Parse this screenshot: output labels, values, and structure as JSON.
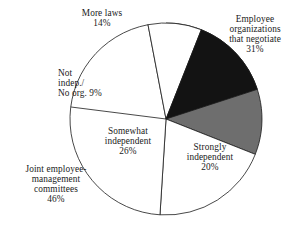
{
  "chart_data": {
    "type": "pie",
    "title": "",
    "subtitle": "",
    "xlabel": "",
    "ylabel": "",
    "legend_position": "none",
    "grid": false,
    "start_angle_deg": 0,
    "direction": "clockwise",
    "units": "percent",
    "total": 100,
    "categories": [
      "Employee organizations that negotiate",
      "Strongly independent",
      "Joint employee-management committees",
      "Not indep./No org.",
      "More laws"
    ],
    "values": [
      31,
      20,
      46,
      9,
      14
    ],
    "colors": [
      "#6e6e6e",
      "#ffffff",
      "#ffffff",
      "#ffffff",
      "#131313"
    ],
    "slices": [
      {
        "name": "employee-organizations",
        "value": 31,
        "value_label": "31%",
        "color": "#6e6e6e",
        "start_deg": 0,
        "end_deg": 111.6,
        "label_lines": [
          "Employee",
          "organizations",
          "that negotiate",
          "31%"
        ]
      },
      {
        "name": "strongly-independent",
        "value": 20,
        "value_label": "20%",
        "color": "#ffffff",
        "start_deg": 111.6,
        "end_deg": 183.6,
        "label_lines": [
          "Strongly",
          "independent",
          "20%"
        ]
      },
      {
        "name": "joint-employee-management-committees",
        "value": 46,
        "value_label": "46%",
        "color": "#ffffff",
        "start_deg": 183.6,
        "end_deg": 349.2,
        "label_lines": [
          "Joint employee-",
          "management",
          "committees",
          "46%"
        ],
        "note": "Label drawn outside at lower left; the 26% Somewhat independent sub-label sits inside this region"
      },
      {
        "name": "not-independent-no-organization",
        "value": 9,
        "value_label": "9%",
        "color": "#ffffff",
        "start_deg": 349.2,
        "end_deg": 381.6,
        "label_lines": [
          "Not",
          "indep./",
          "No org. 9%"
        ]
      },
      {
        "name": "more-laws",
        "value": 14,
        "value_label": "14%",
        "color": "#131313",
        "start_deg": 309.6,
        "end_deg": 360,
        "label_lines": [
          "More laws",
          "14%"
        ]
      }
    ],
    "inner_labels": [
      {
        "name": "somewhat-independent",
        "value": 26,
        "value_label": "26%",
        "label_lines": [
          "Somewhat",
          "independent",
          "26%"
        ]
      }
    ],
    "geometry": {
      "center_x": 166,
      "center_y": 119,
      "radius": 96,
      "stroke_color": "#1a1a1a",
      "stroke_width": 0.8,
      "background": "#ffffff"
    }
  },
  "labels": {
    "more_laws": {
      "l1": "More laws",
      "l2": "14%"
    },
    "employee_orgs": {
      "l1": "Employee",
      "l2": "organizations",
      "l3": "that negotiate",
      "l4": "31%"
    },
    "not_indep": {
      "l1": "Not",
      "l2": "indep./",
      "l3": "No org. 9%"
    },
    "somewhat": {
      "l1": "Somewhat",
      "l2": "independent",
      "l3": "26%"
    },
    "strongly": {
      "l1": "Strongly",
      "l2": "independent",
      "l3": "20%"
    },
    "joint": {
      "l1": "Joint employee-",
      "l2": "management",
      "l3": "committees",
      "l4": "46%"
    }
  }
}
